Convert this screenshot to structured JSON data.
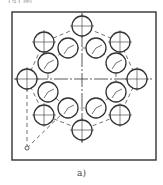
{
  "figure": {
    "top_text_fragment": "(a) 图 … … … … …",
    "caption": "a)",
    "frame": {
      "x": 12,
      "y": 12,
      "width": 144,
      "height": 148,
      "stroke": "#333333"
    },
    "center": {
      "x": 82,
      "y": 79
    },
    "outer_holes": [
      {
        "cx": 82,
        "cy": 26
      },
      {
        "cx": 120,
        "cy": 42
      },
      {
        "cx": 137,
        "cy": 79
      },
      {
        "cx": 120,
        "cy": 115
      },
      {
        "cx": 82,
        "cy": 130
      },
      {
        "cx": 44,
        "cy": 115
      },
      {
        "cx": 27,
        "cy": 79
      },
      {
        "cx": 44,
        "cy": 42
      }
    ],
    "inner_holes": [
      {
        "cx": 68,
        "cy": 48
      },
      {
        "cx": 96,
        "cy": 48
      },
      {
        "cx": 116,
        "cy": 63
      },
      {
        "cx": 116,
        "cy": 92
      },
      {
        "cx": 96,
        "cy": 108
      },
      {
        "cx": 68,
        "cy": 108
      },
      {
        "cx": 48,
        "cy": 92
      },
      {
        "cx": 48,
        "cy": 63
      }
    ],
    "hole_radius": 10,
    "origin_point": {
      "cx": 27,
      "cy": 148
    },
    "line_color": "#333333"
  }
}
